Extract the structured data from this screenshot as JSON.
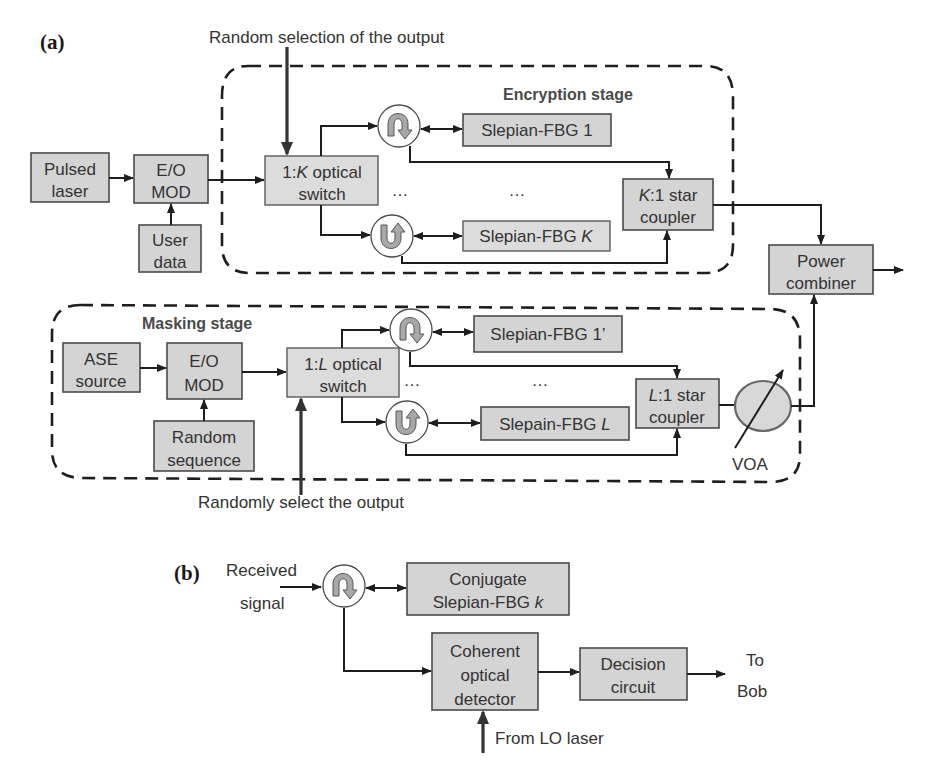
{
  "panel_a": {
    "label": "(a)",
    "top_annotation": "Random selection of the output",
    "bottom_annotation": "Randomly select the output",
    "encryption_stage": {
      "title": "Encryption stage",
      "switch": {
        "line1_pre": "1:",
        "line1_var": "K",
        "line1_post": " optical",
        "line2": "switch"
      },
      "fbg_first": "Slepian-FBG 1",
      "fbg_last_pre": "Slepian-FBG ",
      "fbg_last_var": "K",
      "ellipsis": "…",
      "coupler": {
        "line1_var": "K",
        "line1_post": ":1 star",
        "line2": "coupler"
      }
    },
    "source_chain": {
      "laser": {
        "line1": "Pulsed",
        "line2": "laser"
      },
      "modulator": {
        "line1": "E/O",
        "line2": "MOD"
      },
      "user_data": {
        "line1": "User",
        "line2": "data"
      }
    },
    "power_combiner": {
      "line1": "Power",
      "line2": "combiner"
    },
    "masking_stage": {
      "title": "Masking stage",
      "source": {
        "line1": "ASE",
        "line2": "source"
      },
      "modulator": {
        "line1": "E/O",
        "line2": "MOD"
      },
      "random": {
        "line1": "Random",
        "line2": "sequence"
      },
      "switch": {
        "line1_pre": "1:",
        "line1_var": "L",
        "line1_post": " optical",
        "line2": "switch"
      },
      "fbg_first": "Slepian-FBG 1’",
      "fbg_last_pre": "Slepain-FBG ",
      "fbg_last_var": "L",
      "ellipsis": "…",
      "coupler": {
        "line1_var": "L",
        "line1_post": ":1 star",
        "line2": "coupler"
      },
      "voa": "VOA"
    }
  },
  "panel_b": {
    "label": "(b)",
    "input": {
      "line1": "Received",
      "line2": "signal"
    },
    "fbg": {
      "line1": "Conjugate",
      "line2_pre": "Slepian-FBG ",
      "line2_var": "k"
    },
    "detector": {
      "line1": "Coherent",
      "line2": "optical",
      "line3": "detector"
    },
    "decision": {
      "line1": "Decision",
      "line2": "circuit"
    },
    "output": {
      "line1": "To",
      "line2": "Bob"
    },
    "lo": "From LO laser"
  },
  "colors": {
    "box_fill": "#d4d4d4",
    "box_stroke": "#4a4a4a",
    "line": "#1e1e1e",
    "circulator_arrow": "#a8a8a8"
  }
}
